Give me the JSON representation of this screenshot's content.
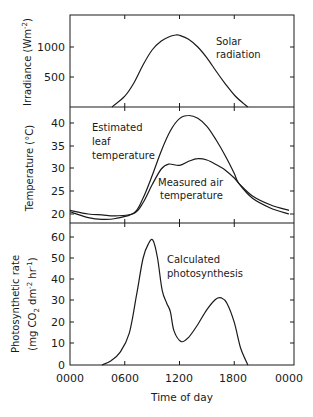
{
  "figure": {
    "x_axis_label": "Time of day",
    "x_tick_labels": [
      "0000",
      "0600",
      "1200",
      "1800",
      "0000"
    ],
    "panels": [
      {
        "id": "irradiance",
        "ylabel": "Irradiance (Wm",
        "ylabel_sup": "-2",
        "ylabel_close": ")",
        "y_tick_labels": [
          "1000",
          "500"
        ],
        "annotation_lines": [
          "Solar",
          "radiation"
        ]
      },
      {
        "id": "temperature",
        "ylabel": "Temperature (°C)",
        "y_tick_labels": [
          "40",
          "35",
          "30",
          "25",
          "20"
        ],
        "annotations": [
          {
            "lines": [
              "Estimated",
              "leaf",
              "temperature"
            ]
          },
          {
            "lines": [
              "Measured air",
              "temperature"
            ]
          }
        ]
      },
      {
        "id": "photosynthesis",
        "ylabel_line1": "Photosynthetic rate",
        "ylabel_line2": "(mg CO2 dm-2 hr-1)",
        "ylabel_l2_a": "(mg CO",
        "ylabel_l2_sub": "2",
        "ylabel_l2_b": " dm",
        "ylabel_l2_sup1": "-2",
        "ylabel_l2_c": " hr",
        "ylabel_l2_sup2": "-1",
        "ylabel_l2_d": ")",
        "y_tick_labels": [
          "60",
          "50",
          "40",
          "30",
          "20",
          "10",
          "0"
        ],
        "annotation_lines": [
          "Calculated",
          "photosynthesis"
        ]
      }
    ]
  },
  "chart_data": [
    {
      "type": "line",
      "title": "Solar radiation",
      "xlabel": "Time of day (h)",
      "ylabel": "Irradiance (W m^-2)",
      "xlim": [
        0,
        24
      ],
      "ylim": [
        0,
        1500
      ],
      "x_ticks": [
        0,
        6,
        12,
        18,
        24
      ],
      "x_tick_labels": [
        "0000",
        "0600",
        "1200",
        "1800",
        "0000"
      ],
      "y_ticks": [
        500,
        1000
      ],
      "grid": false,
      "series": [
        {
          "name": "Solar radiation",
          "x": [
            4.6,
            6,
            7,
            8,
            9,
            10,
            11,
            11.6,
            12,
            13,
            14,
            15,
            16,
            17,
            18,
            19,
            19.5
          ],
          "y": [
            0,
            180,
            400,
            700,
            950,
            1100,
            1180,
            1200,
            1195,
            1130,
            1000,
            820,
            600,
            390,
            200,
            60,
            0
          ]
        }
      ]
    },
    {
      "type": "line",
      "title": "Temperature",
      "xlabel": "Time of day (h)",
      "ylabel": "Temperature (°C)",
      "xlim": [
        0,
        24
      ],
      "ylim": [
        18,
        43
      ],
      "x_ticks": [
        0,
        6,
        12,
        18,
        24
      ],
      "y_ticks": [
        20,
        25,
        30,
        35,
        40
      ],
      "grid": false,
      "series": [
        {
          "name": "Estimated leaf temperature",
          "x": [
            0,
            2,
            3.5,
            5,
            7,
            8,
            9,
            10,
            11,
            12,
            13,
            14,
            15,
            16,
            17,
            18,
            18.5,
            20,
            22,
            24
          ],
          "y": [
            20.5,
            19.2,
            18.8,
            19.0,
            20.2,
            23.5,
            28.5,
            34,
            38.5,
            41.2,
            41.9,
            41.3,
            39.5,
            36.5,
            33,
            29,
            26.8,
            23.5,
            21.3,
            20.0
          ]
        },
        {
          "name": "Measured air temperature",
          "x": [
            0,
            2,
            3.5,
            5,
            7,
            8,
            9,
            10,
            10.8,
            12,
            13,
            14,
            15,
            16,
            17,
            18,
            18.5,
            20,
            22,
            24
          ],
          "y": [
            20.8,
            20.0,
            19.8,
            19.6,
            20.1,
            22.5,
            26.5,
            30.0,
            31.1,
            30.8,
            31.7,
            32.3,
            32.0,
            31.0,
            29.8,
            28.0,
            26.8,
            24.0,
            22.0,
            20.8
          ]
        }
      ]
    },
    {
      "type": "line",
      "title": "Calculated photosynthesis",
      "xlabel": "Time of day",
      "ylabel": "Photosynthetic rate (mg CO2 dm^-2 hr^-1)",
      "xlim": [
        0,
        24
      ],
      "ylim": [
        0,
        65
      ],
      "x_ticks": [
        0,
        6,
        12,
        18,
        24
      ],
      "x_tick_labels": [
        "0000",
        "0600",
        "1200",
        "1800",
        "0000"
      ],
      "y_ticks": [
        0,
        10,
        20,
        30,
        40,
        50,
        60
      ],
      "grid": false,
      "series": [
        {
          "name": "Calculated photosynthesis",
          "x": [
            3.5,
            4.5,
            5.5,
            6.5,
            7.3,
            8,
            8.6,
            9.1,
            9.6,
            10.1,
            10.6,
            11,
            11.4,
            12.2,
            13,
            14,
            15,
            16,
            16.6,
            17.2,
            18,
            18.7,
            19.5
          ],
          "y": [
            0,
            2,
            6,
            15,
            33,
            50,
            57,
            58.5,
            50,
            35,
            29,
            25,
            16,
            11,
            13,
            19,
            26,
            31,
            31.5,
            29,
            20,
            8,
            0
          ]
        }
      ]
    }
  ]
}
